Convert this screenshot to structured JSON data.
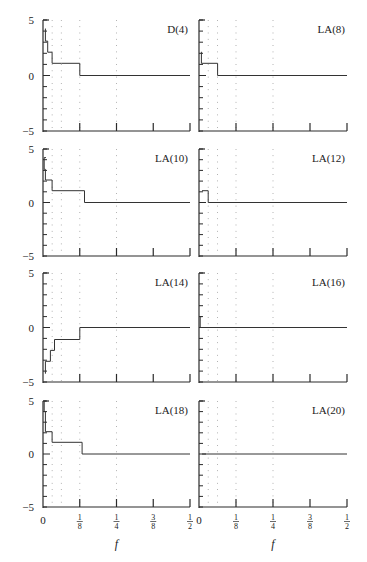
{
  "chart_data": [
    {
      "type": "line",
      "title": "D(4)",
      "xlabel": "f",
      "ylabel": "",
      "xlim": [
        0,
        0.5
      ],
      "ylim": [
        -5,
        5
      ],
      "x_ticks": [
        "0",
        "1/8",
        "1/4",
        "3/8",
        "1/2"
      ],
      "y_ticks": [
        "-5",
        "0",
        "5"
      ],
      "reference_lines_f": [
        0.03125,
        0.0625,
        0.125,
        0.25
      ],
      "steps": [
        {
          "f_start": 0.0,
          "f_end": 0.008,
          "value": 4.2
        },
        {
          "f_start": 0.008,
          "f_end": 0.016,
          "value": 3.1
        },
        {
          "f_start": 0.016,
          "f_end": 0.031,
          "value": 2.1
        },
        {
          "f_start": 0.031,
          "f_end": 0.063,
          "value": 1.1
        },
        {
          "f_start": 0.063,
          "f_end": 0.125,
          "value": 1.1
        },
        {
          "f_start": 0.125,
          "f_end": 0.5,
          "value": 0.0
        }
      ]
    },
    {
      "type": "line",
      "title": "LA(8)",
      "xlabel": "f",
      "xlim": [
        0,
        0.5
      ],
      "ylim": [
        -5,
        5
      ],
      "x_ticks": [
        "0",
        "1/8",
        "1/4",
        "3/8",
        "1/2"
      ],
      "y_ticks": [
        "-5",
        "0",
        "5"
      ],
      "steps": [
        {
          "f_start": 0.0,
          "f_end": 0.008,
          "value": 2.1
        },
        {
          "f_start": 0.008,
          "f_end": 0.063,
          "value": 1.1
        },
        {
          "f_start": 0.063,
          "f_end": 0.5,
          "value": 0.0
        }
      ]
    },
    {
      "type": "line",
      "title": "LA(10)",
      "xlabel": "f",
      "xlim": [
        0,
        0.5
      ],
      "ylim": [
        -5,
        5
      ],
      "x_ticks": [
        "0",
        "1/8",
        "1/4",
        "3/8",
        "1/2"
      ],
      "y_ticks": [
        "-5",
        "0",
        "5"
      ],
      "steps": [
        {
          "f_start": 0.0,
          "f_end": 0.004,
          "value": 4.2
        },
        {
          "f_start": 0.004,
          "f_end": 0.008,
          "value": 3.1
        },
        {
          "f_start": 0.008,
          "f_end": 0.031,
          "value": 2.1
        },
        {
          "f_start": 0.031,
          "f_end": 0.141,
          "value": 1.1
        },
        {
          "f_start": 0.141,
          "f_end": 0.5,
          "value": 0.0
        }
      ]
    },
    {
      "type": "line",
      "title": "LA(12)",
      "xlabel": "f",
      "xlim": [
        0,
        0.5
      ],
      "ylim": [
        -5,
        5
      ],
      "x_ticks": [
        "0",
        "1/8",
        "1/4",
        "3/8",
        "1/2"
      ],
      "y_ticks": [
        "-5",
        "0",
        "5"
      ],
      "steps": [
        {
          "f_start": 0.0,
          "f_end": 0.031,
          "value": 1.1
        },
        {
          "f_start": 0.031,
          "f_end": 0.5,
          "value": 0.0
        }
      ]
    },
    {
      "type": "line",
      "title": "LA(14)",
      "xlabel": "f",
      "xlim": [
        0,
        0.5
      ],
      "ylim": [
        -5,
        5
      ],
      "x_ticks": [
        "0",
        "1/8",
        "1/4",
        "3/8",
        "1/2"
      ],
      "y_ticks": [
        "-5",
        "0",
        "5"
      ],
      "steps": [
        {
          "f_start": 0.0,
          "f_end": 0.008,
          "value": -4.2
        },
        {
          "f_start": 0.008,
          "f_end": 0.025,
          "value": -3.1
        },
        {
          "f_start": 0.025,
          "f_end": 0.039,
          "value": -2.1
        },
        {
          "f_start": 0.039,
          "f_end": 0.125,
          "value": -1.1
        },
        {
          "f_start": 0.125,
          "f_end": 0.5,
          "value": 0.0
        }
      ]
    },
    {
      "type": "line",
      "title": "LA(16)",
      "xlabel": "f",
      "xlim": [
        0,
        0.5
      ],
      "ylim": [
        -5,
        5
      ],
      "x_ticks": [
        "0",
        "1/8",
        "1/4",
        "3/8",
        "1/2"
      ],
      "y_ticks": [
        "-5",
        "0",
        "5"
      ],
      "steps": [
        {
          "f_start": 0.0,
          "f_end": 0.004,
          "value": 1.0
        },
        {
          "f_start": 0.004,
          "f_end": 0.5,
          "value": 0.0
        }
      ]
    },
    {
      "type": "line",
      "title": "LA(18)",
      "xlabel": "f",
      "xlim": [
        0,
        0.5
      ],
      "ylim": [
        -5,
        5
      ],
      "x_ticks": [
        "0",
        "1/8",
        "1/4",
        "3/8",
        "1/2"
      ],
      "y_ticks": [
        "-5",
        "0",
        "5"
      ],
      "steps": [
        {
          "f_start": 0.0,
          "f_end": 0.004,
          "value": 5.0
        },
        {
          "f_start": 0.004,
          "f_end": 0.008,
          "value": 4.0
        },
        {
          "f_start": 0.008,
          "f_end": 0.031,
          "value": 2.1
        },
        {
          "f_start": 0.031,
          "f_end": 0.133,
          "value": 1.1
        },
        {
          "f_start": 0.133,
          "f_end": 0.5,
          "value": 0.0
        }
      ]
    },
    {
      "type": "line",
      "title": "LA(20)",
      "xlabel": "f",
      "xlim": [
        0,
        0.5
      ],
      "ylim": [
        -5,
        5
      ],
      "x_ticks": [
        "0",
        "1/8",
        "1/4",
        "3/8",
        "1/2"
      ],
      "y_ticks": [
        "-5",
        "0",
        "5"
      ],
      "steps": [
        {
          "f_start": 0.0,
          "f_end": 0.5,
          "value": 0.0
        }
      ]
    }
  ],
  "labels": {
    "xlabel": "f",
    "ytick_top": "5",
    "ytick_mid": "0",
    "ytick_bottom": "−5",
    "xtick_0": "0",
    "panel_titles": [
      "D(4)",
      "LA(8)",
      "LA(10)",
      "LA(12)",
      "LA(14)",
      "LA(16)",
      "LA(18)",
      "LA(20)"
    ]
  }
}
